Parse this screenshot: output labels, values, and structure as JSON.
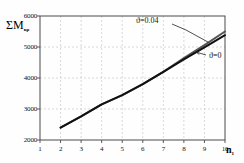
{
  "chart_data": {
    "type": "line",
    "title": "",
    "xlabel": "n",
    "xlabel_sub": "1",
    "ylabel": "ΣM",
    "ylabel_sub": "кр",
    "xlim": [
      1,
      10
    ],
    "ylim": [
      2000,
      6000
    ],
    "xticks": [
      1,
      2,
      3,
      4,
      5,
      6,
      7,
      8,
      9,
      10
    ],
    "yticks": [
      2000,
      3000,
      4000,
      5000,
      6000
    ],
    "xtick_labels": [
      "1",
      "2",
      "3",
      "4",
      "5",
      "6",
      "7",
      "8",
      "9",
      "10"
    ],
    "ytick_labels": [
      "2000",
      "3000",
      "4000",
      "5000",
      "6000"
    ],
    "grid": true,
    "grid_style": "dashed",
    "legend": "annotations",
    "series": [
      {
        "name": "ϑ=0.04",
        "color": "#555555",
        "x": [
          2,
          3,
          4,
          5,
          6,
          7,
          8,
          9,
          10
        ],
        "values": [
          2400,
          2760,
          3150,
          3450,
          3800,
          4200,
          4640,
          5060,
          5500
        ]
      },
      {
        "name": "ϑ=0",
        "color": "#111111",
        "x": [
          2,
          3,
          4,
          5,
          6,
          7,
          8,
          9,
          10
        ],
        "values": [
          2400,
          2760,
          3150,
          3450,
          3800,
          4200,
          4600,
          4990,
          5380
        ]
      }
    ],
    "annotations": [
      {
        "text": "ϑ=0.04",
        "target_x": 9.2,
        "target_y": 5150
      },
      {
        "text": "ϑ=0",
        "target_x": 8.75,
        "target_y": 4760
      }
    ]
  },
  "colors": {
    "grid": "#c9c9c9",
    "frame": "#4a4a4a",
    "curve_upper": "#555555",
    "curve_lower": "#111111",
    "text": "#111111",
    "background": "#ffffff"
  }
}
